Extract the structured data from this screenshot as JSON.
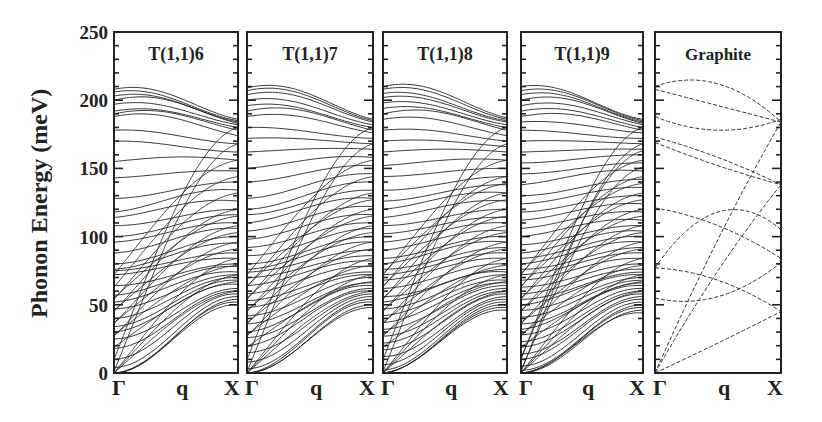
{
  "chart_data": {
    "type": "line",
    "title": "",
    "ylabel": "Phonon Energy (meV)",
    "xlabel": "q",
    "ylim": [
      0,
      250
    ],
    "yticks": [
      0,
      50,
      100,
      150,
      200,
      250
    ],
    "y_minor_step": 10,
    "x_tick_labels": [
      "Γ",
      "q",
      "X"
    ],
    "grid": false,
    "legend": null,
    "panels": [
      {
        "label": "T(1,1)6",
        "gamma_modes_meV": [
          0,
          0,
          0,
          4,
          10,
          18,
          25,
          30,
          34,
          40,
          47,
          52,
          57,
          64,
          72,
          75,
          76,
          80,
          88,
          96,
          100,
          108,
          114,
          118,
          128,
          143,
          155,
          170,
          178,
          188,
          190,
          192,
          197,
          200,
          203,
          206,
          208
        ],
        "x_modes_meV": [
          50,
          52,
          54,
          56,
          58,
          60,
          62,
          65,
          68,
          70,
          72,
          74,
          78,
          80,
          84,
          88,
          95,
          100,
          106,
          110,
          116,
          120,
          126,
          134,
          140,
          148,
          156,
          162,
          168,
          174,
          178,
          180,
          182,
          183,
          184,
          185,
          186
        ],
        "description": "Dense phonon dispersion of (6,6) armchair-like tube; optical bands 180-210 meV converge near X ~180 meV"
      },
      {
        "label": "T(1,1)7",
        "gamma_modes_meV": [
          0,
          0,
          0,
          3,
          8,
          15,
          20,
          26,
          30,
          36,
          42,
          48,
          53,
          58,
          64,
          70,
          74,
          76,
          80,
          86,
          92,
          98,
          104,
          110,
          116,
          120,
          128,
          140,
          150,
          162,
          172,
          180,
          188,
          192,
          196,
          200,
          204,
          207,
          209
        ],
        "x_modes_meV": [
          48,
          50,
          52,
          54,
          56,
          58,
          60,
          62,
          64,
          66,
          70,
          72,
          74,
          78,
          82,
          86,
          90,
          96,
          100,
          106,
          110,
          116,
          122,
          128,
          134,
          140,
          146,
          152,
          158,
          164,
          168,
          172,
          176,
          178,
          180,
          182,
          184,
          185,
          186
        ],
        "description": "Phonon dispersion of T(1,1)7"
      },
      {
        "label": "T(1,1)8",
        "gamma_modes_meV": [
          0,
          0,
          0,
          2,
          6,
          12,
          17,
          22,
          27,
          32,
          37,
          42,
          47,
          52,
          56,
          62,
          68,
          72,
          76,
          80,
          84,
          90,
          96,
          102,
          108,
          114,
          120,
          126,
          134,
          144,
          152,
          162,
          170,
          178,
          186,
          190,
          194,
          198,
          202,
          205,
          208,
          210
        ],
        "x_modes_meV": [
          46,
          48,
          50,
          52,
          54,
          56,
          58,
          60,
          62,
          64,
          66,
          68,
          72,
          74,
          76,
          80,
          84,
          88,
          92,
          96,
          100,
          104,
          110,
          114,
          120,
          126,
          132,
          138,
          144,
          150,
          156,
          162,
          166,
          170,
          174,
          178,
          180,
          182,
          184,
          185,
          186,
          187
        ],
        "description": "Phonon dispersion of T(1,1)8"
      },
      {
        "label": "T(1,1)9",
        "gamma_modes_meV": [
          0,
          0,
          0,
          2,
          5,
          10,
          14,
          19,
          23,
          28,
          32,
          36,
          41,
          46,
          50,
          54,
          58,
          63,
          68,
          72,
          76,
          80,
          84,
          88,
          94,
          100,
          106,
          112,
          118,
          124,
          130,
          138,
          146,
          154,
          162,
          170,
          178,
          184,
          188,
          192,
          196,
          200,
          204,
          207,
          210
        ],
        "x_modes_meV": [
          44,
          46,
          48,
          50,
          52,
          54,
          56,
          58,
          60,
          62,
          64,
          66,
          68,
          70,
          72,
          74,
          76,
          80,
          84,
          88,
          92,
          96,
          100,
          104,
          108,
          112,
          118,
          124,
          130,
          136,
          142,
          148,
          154,
          160,
          164,
          168,
          172,
          176,
          178,
          180,
          182,
          183,
          184,
          185,
          186
        ],
        "description": "Phonon dispersion of T(1,1)9"
      },
      {
        "label": "Graphite",
        "line_style": "dashed",
        "branches": [
          {
            "gamma": 210,
            "mid": 212,
            "x": 184
          },
          {
            "gamma": 208,
            "mid": 196,
            "x": 184
          },
          {
            "gamma": 188,
            "mid": 178,
            "x": 186
          },
          {
            "gamma": 173,
            "mid": 158,
            "x": 138
          },
          {
            "gamma": 169,
            "mid": 152,
            "x": 138
          },
          {
            "gamma": 121,
            "mid": 108,
            "x": 84
          },
          {
            "gamma": 77,
            "mid": 68,
            "x": 45
          },
          {
            "gamma": 55,
            "mid": 56,
            "x": 81
          },
          {
            "gamma": 77,
            "mid": 118,
            "x": 105
          },
          {
            "gamma": 0,
            "mid": 98,
            "x": 184
          },
          {
            "gamma": 0,
            "mid": 75,
            "x": 138
          },
          {
            "gamma": 0,
            "mid": 22,
            "x": 45
          }
        ],
        "description": "Graphite phonon dispersion along Γ-X shown with dashed lines"
      }
    ]
  },
  "axis": {
    "ylabel": "Phonon Energy (meV)",
    "ytick_labels": [
      "0",
      "50",
      "100",
      "150",
      "200",
      "250"
    ],
    "xtick_gamma": "Γ",
    "xtick_q": "q",
    "xtick_x": "X"
  },
  "panel_labels": [
    "T(1,1)6",
    "T(1,1)7",
    "T(1,1)8",
    "T(1,1)9",
    "Graphite"
  ]
}
